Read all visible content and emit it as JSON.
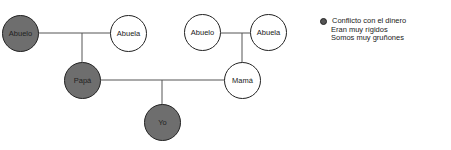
{
  "diagram": {
    "type": "genogram",
    "nodes": [
      {
        "id": "abuelo_paterno",
        "label": "Abuelo",
        "shaded": true
      },
      {
        "id": "abuela_paterna",
        "label": "Abuela",
        "shaded": false
      },
      {
        "id": "abuelo_materno",
        "label": "Abuelo",
        "shaded": false
      },
      {
        "id": "abuela_materna",
        "label": "Abuela",
        "shaded": false
      },
      {
        "id": "papa",
        "label": "Papá",
        "shaded": true
      },
      {
        "id": "mama",
        "label": "Mamá",
        "shaded": false
      },
      {
        "id": "yo",
        "label": "Yo",
        "shaded": true
      }
    ],
    "relations": [
      {
        "type": "couple",
        "members": [
          "abuelo_paterno",
          "abuela_paterna"
        ],
        "children": [
          "papa"
        ]
      },
      {
        "type": "couple",
        "members": [
          "abuelo_materno",
          "abuela_materna"
        ],
        "children": [
          "mama"
        ]
      },
      {
        "type": "couple",
        "members": [
          "papa",
          "mama"
        ],
        "children": [
          "yo"
        ]
      }
    ]
  },
  "legend": {
    "marker": "filled-circle",
    "lines": [
      "Conflicto con el dinero",
      "Eran muy rígidos",
      "Somos muy gruñones"
    ]
  },
  "colors": {
    "shaded": "#6e6e6e",
    "outline": "#222222",
    "line": "#555555"
  }
}
